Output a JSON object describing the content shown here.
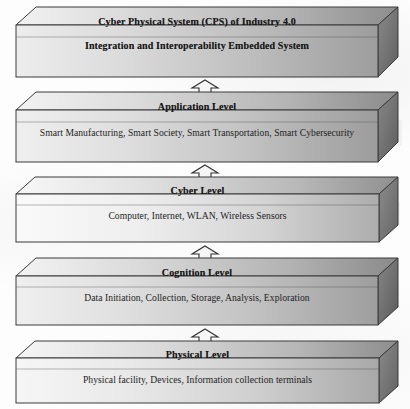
{
  "diagram": {
    "name": "cps-industry40-layered-architecture",
    "orientation": "vertical-stack",
    "connector_type": "double-headed-arrow",
    "palette": {
      "front_light": "#e9e9e9",
      "front_dark": "#9a9a9a",
      "top_light": "#efefef",
      "top_dark": "#8f8f8f",
      "side_dark": "#6f6f6f",
      "outline": "#3a3a3a",
      "text": "#161616"
    },
    "blocks": [
      {
        "id": "cps-header",
        "title": "Cyber Physical System (CPS) of Industry 4.0",
        "subtitle": "Integration and Interoperability Embedded System",
        "body": "",
        "tone": "medium"
      },
      {
        "id": "application-level",
        "title": "Application Level",
        "subtitle": "",
        "body": "Smart Manufacturing, Smart Society, Smart Transportation, Smart Cybersecurity",
        "tone": "medium"
      },
      {
        "id": "cyber-level",
        "title": "Cyber Level",
        "subtitle": "",
        "body": "Computer, Internet, WLAN, Wireless Sensors",
        "tone": "light"
      },
      {
        "id": "cognition-level",
        "title": "Cognition Level",
        "subtitle": "",
        "body": "Data Initiation, Collection, Storage, Analysis, Exploration",
        "tone": "medium"
      },
      {
        "id": "physical-level",
        "title": "Physical Level",
        "subtitle": "",
        "body": "Physical facility, Devices, Information collection terminals",
        "tone": "light"
      }
    ],
    "connectors": [
      {
        "id": "conn-cps-application",
        "from": "cps-header",
        "to": "application-level",
        "direction": "bidirectional"
      },
      {
        "id": "conn-application-cyber",
        "from": "application-level",
        "to": "cyber-level",
        "direction": "bidirectional"
      },
      {
        "id": "conn-cyber-cognition",
        "from": "cyber-level",
        "to": "cognition-level",
        "direction": "bidirectional"
      },
      {
        "id": "conn-cognition-physical",
        "from": "cognition-level",
        "to": "physical-level",
        "direction": "bidirectional"
      }
    ]
  }
}
